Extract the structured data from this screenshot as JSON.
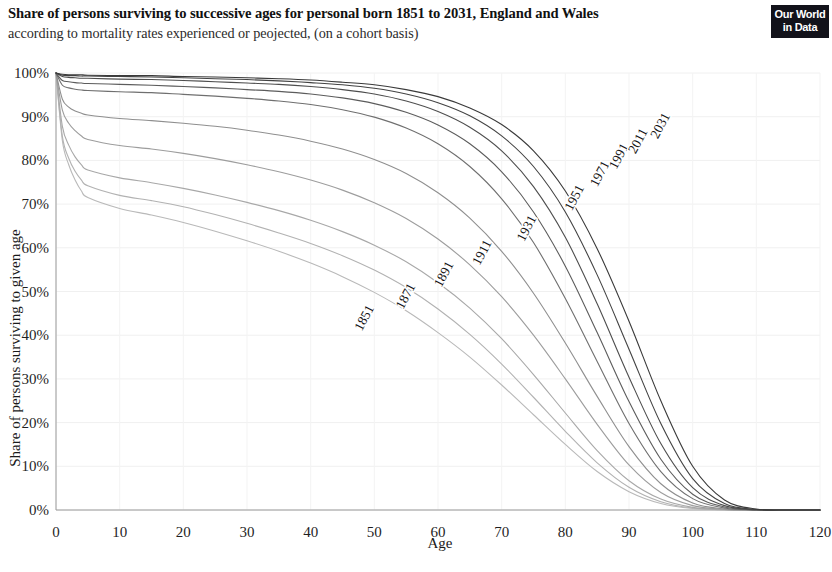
{
  "header": {
    "title": "Share of persons surviving to successive ages for personal born 1851 to 2031, England and Wales",
    "subtitle": "according to mortality rates experienced or peojected, (on a cohort basis)"
  },
  "logo": {
    "line1": "Our World",
    "line2": "in Data"
  },
  "chart_data": {
    "type": "line",
    "title": "Share of persons surviving to successive ages for personal born 1851 to 2031, England and Wales",
    "subtitle": "according to mortality rates experienced or peojected, (on a cohort basis)",
    "xlabel": "Age",
    "ylabel": "Share of persons surviving to given age",
    "xlim": [
      0,
      120
    ],
    "ylim": [
      0,
      100
    ],
    "xticks": [
      0,
      10,
      20,
      30,
      40,
      50,
      60,
      70,
      80,
      90,
      100,
      110,
      120
    ],
    "xtick_labels": [
      "0",
      "10",
      "20",
      "30",
      "40",
      "50",
      "60",
      "70",
      "80",
      "90",
      "100",
      "110",
      "120"
    ],
    "yticks": [
      0,
      10,
      20,
      30,
      40,
      50,
      60,
      70,
      80,
      90,
      100
    ],
    "ytick_labels": [
      "0%",
      "10%",
      "20%",
      "30%",
      "40%",
      "50%",
      "60%",
      "70%",
      "80%",
      "90%",
      "100%"
    ],
    "grid": "faint-vertical-and-horizontal",
    "legend": "inline-labels-on-curves",
    "x": [
      0,
      1,
      2,
      3,
      4,
      5,
      10,
      15,
      20,
      25,
      30,
      35,
      40,
      45,
      50,
      55,
      60,
      65,
      70,
      75,
      80,
      85,
      90,
      95,
      100,
      105,
      110,
      115,
      120
    ],
    "series": [
      {
        "name": "1851",
        "label": "1851",
        "color": "#b9b9b9",
        "label_x": 49,
        "label_y": 43.5,
        "values": [
          100,
          84.5,
          79.0,
          75.5,
          73.0,
          71.5,
          69.0,
          67.5,
          65.8,
          63.8,
          61.6,
          59.2,
          56.5,
          53.4,
          49.8,
          45.6,
          40.6,
          35.0,
          28.6,
          21.8,
          15.0,
          8.8,
          4.2,
          1.5,
          0.35,
          0.05,
          0.0,
          0.0,
          0.0
        ]
      },
      {
        "name": "1871",
        "label": "1871",
        "color": "#b2b2b2",
        "label_x": 55.5,
        "label_y": 48.5,
        "values": [
          100,
          85.5,
          80.5,
          77.5,
          75.5,
          74.2,
          72.0,
          70.8,
          69.4,
          67.6,
          65.6,
          63.4,
          61.0,
          58.2,
          54.9,
          50.9,
          46.0,
          40.2,
          33.4,
          25.8,
          18.0,
          10.8,
          5.2,
          1.9,
          0.45,
          0.06,
          0.0,
          0.0,
          0.0
        ]
      },
      {
        "name": "1891",
        "label": "1891",
        "color": "#a8a8a8",
        "label_x": 61.5,
        "label_y": 53.5,
        "values": [
          100,
          87.8,
          83.5,
          80.8,
          79.0,
          77.8,
          76.0,
          74.9,
          73.6,
          72.1,
          70.4,
          68.5,
          66.3,
          63.7,
          60.6,
          56.8,
          52.0,
          46.2,
          39.2,
          31.0,
          22.2,
          13.6,
          6.7,
          2.5,
          0.6,
          0.08,
          0.0,
          0.0,
          0.0
        ]
      },
      {
        "name": "1911",
        "label": "1911",
        "color": "#9d9d9d",
        "label_x": 67.5,
        "label_y": 58.5,
        "values": [
          100,
          91.5,
          88.5,
          86.8,
          85.6,
          84.8,
          83.4,
          82.6,
          81.6,
          80.4,
          79.0,
          77.4,
          75.5,
          73.2,
          70.3,
          66.7,
          62.0,
          56.1,
          48.8,
          40.0,
          30.0,
          19.6,
          10.3,
          4.0,
          1.0,
          0.14,
          0.0,
          0.0,
          0.0
        ]
      },
      {
        "name": "1931",
        "label": "1931",
        "color": "#8f8f8f",
        "label_x": 74.5,
        "label_y": 64.0,
        "values": [
          100,
          94.0,
          92.2,
          91.3,
          90.8,
          90.4,
          89.6,
          89.1,
          88.5,
          87.8,
          86.9,
          85.8,
          84.4,
          82.6,
          80.2,
          77.0,
          72.6,
          66.8,
          59.2,
          49.6,
          38.2,
          26.0,
          14.5,
          6.0,
          1.6,
          0.25,
          0.01,
          0.0,
          0.0
        ]
      },
      {
        "name": "1951",
        "label": "1951",
        "color": "#6f6f6f",
        "label_x": 82.0,
        "label_y": 71.0,
        "values": [
          100,
          97.2,
          96.6,
          96.3,
          96.1,
          96.0,
          95.7,
          95.5,
          95.1,
          94.7,
          94.2,
          93.6,
          92.8,
          91.6,
          89.9,
          87.4,
          83.8,
          78.6,
          71.2,
          61.2,
          48.4,
          34.0,
          19.8,
          8.8,
          2.6,
          0.45,
          0.02,
          0.0,
          0.0
        ]
      },
      {
        "name": "1971",
        "label": "1971",
        "color": "#5c5c5c",
        "label_x": 86.0,
        "label_y": 76.5,
        "values": [
          100,
          98.3,
          98.0,
          97.8,
          97.7,
          97.6,
          97.4,
          97.2,
          96.9,
          96.6,
          96.2,
          95.8,
          95.2,
          94.3,
          93.0,
          91.0,
          88.1,
          83.8,
          77.4,
          68.2,
          55.8,
          40.6,
          24.8,
          11.6,
          3.6,
          0.68,
          0.04,
          0.0,
          0.0
        ]
      },
      {
        "name": "1991",
        "label": "1991",
        "color": "#4e4e4e",
        "label_x": 89.0,
        "label_y": 80.5,
        "values": [
          100,
          99.2,
          99.0,
          98.9,
          98.8,
          98.8,
          98.6,
          98.5,
          98.3,
          98.0,
          97.7,
          97.4,
          96.9,
          96.2,
          95.2,
          93.6,
          91.2,
          87.6,
          82.2,
          74.0,
          62.4,
          47.2,
          30.4,
          15.2,
          5.1,
          1.0,
          0.07,
          0.0,
          0.0
        ]
      },
      {
        "name": "2011",
        "label": "2011",
        "color": "#434343",
        "label_x": 92.0,
        "label_y": 84.0,
        "values": [
          100,
          99.5,
          99.4,
          99.4,
          99.3,
          99.3,
          99.2,
          99.1,
          98.9,
          98.7,
          98.5,
          98.2,
          97.8,
          97.3,
          96.5,
          95.2,
          93.2,
          90.2,
          85.6,
          78.6,
          68.2,
          53.8,
          36.8,
          19.8,
          7.2,
          1.5,
          0.12,
          0.0,
          0.0
        ]
      },
      {
        "name": "2031",
        "label": "2031",
        "color": "#3a3a3a",
        "label_x": 95.5,
        "label_y": 87.5,
        "values": [
          100,
          99.7,
          99.6,
          99.6,
          99.6,
          99.5,
          99.4,
          99.4,
          99.2,
          99.1,
          98.9,
          98.7,
          98.4,
          97.9,
          97.3,
          96.2,
          94.6,
          92.0,
          88.2,
          82.2,
          73.0,
          59.8,
          43.2,
          25.0,
          10.0,
          2.3,
          0.22,
          0.01,
          0.0
        ]
      }
    ]
  }
}
